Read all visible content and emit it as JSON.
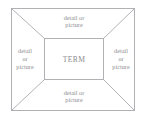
{
  "diagram": {
    "type": "frayer-model",
    "center": {
      "label": "TERM"
    },
    "zones": {
      "top": {
        "label": "detail or\npicture"
      },
      "right": {
        "label": "detail\nor\npicture"
      },
      "bottom": {
        "label": "detail or\npicture"
      },
      "left": {
        "label": "detail\nor\npicture"
      }
    },
    "colors": {
      "background": "#ffffff",
      "stroke": "#a9a9ae",
      "text": "#8d8d92",
      "center_text": "#8a8a8f"
    },
    "geometry": {
      "outer_rect": {
        "x": 11,
        "y": 8,
        "width": 124,
        "height": 103
      },
      "inner_rect": {
        "x": 44,
        "y": 38,
        "width": 60,
        "height": 42
      },
      "stroke_width": 0.9,
      "diagonals": 4
    }
  }
}
